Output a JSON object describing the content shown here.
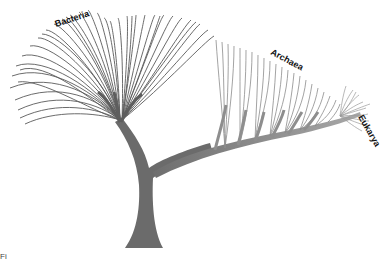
{
  "diagram": {
    "domains": [
      {
        "name": "Bacteria",
        "color": "#555555"
      },
      {
        "name": "Archaea",
        "color": "#8a8a8a"
      },
      {
        "name": "Eukarya",
        "color": "#9a9a9a"
      }
    ],
    "trunk_color": "#6b6b6b",
    "caption_fragment": "Fi"
  }
}
